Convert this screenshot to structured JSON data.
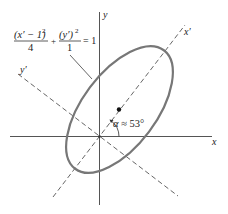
{
  "figure": {
    "type": "rotated-ellipse",
    "equation": {
      "term1_numerator": "(x′ − 1)",
      "term1_exponent": "2",
      "term1_denominator": "4",
      "plus": "+",
      "term2_numerator": "(y′)",
      "term2_exponent": "2",
      "term2_denominator": "1",
      "equals": "= 1"
    },
    "axes": {
      "x_label": "x",
      "y_label": "y",
      "x_prime_label": "x′",
      "y_prime_label": "y′"
    },
    "angle_label": {
      "symbol": "α",
      "text": " ≈ 53°"
    },
    "colors": {
      "axis": "#555555",
      "ellipse": "#777777",
      "dashed": "#666666",
      "text": "#222222"
    }
  }
}
